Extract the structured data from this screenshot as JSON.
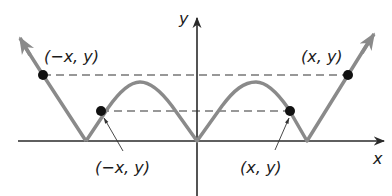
{
  "diagram": {
    "type": "even-function-graph",
    "axes": {
      "x_label": "x",
      "y_label": "y"
    },
    "points": [
      {
        "label": "(−x, y)",
        "position": "upper-left",
        "on": "left outer line"
      },
      {
        "label": "(x, y)",
        "position": "upper-right",
        "on": "right outer line"
      },
      {
        "label": "(−x, y)",
        "position": "lower-left",
        "on": "left hump",
        "with_pointer": true
      },
      {
        "label": "(x, y)",
        "position": "lower-right",
        "on": "right hump",
        "with_pointer": true
      }
    ],
    "colors": {
      "curve": "#8a8a8a",
      "axes": "#2a2a2a",
      "dashes": "#333333",
      "points": "#111111",
      "background": "#ffffff"
    }
  }
}
